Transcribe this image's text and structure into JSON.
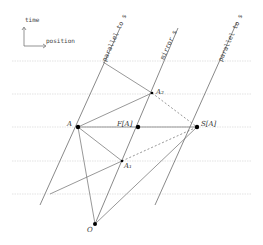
{
  "diagram": {
    "axes": {
      "vertical_label": "time",
      "horizontal_label": "position"
    },
    "world_lines": [
      {
        "id": "left",
        "label": "parallel to s"
      },
      {
        "id": "mirror",
        "label": "mirror s"
      },
      {
        "id": "right",
        "label": "parallel to s"
      }
    ],
    "points": {
      "A": "A",
      "FA": "F[A]",
      "SA": "S[A]",
      "A1": "A₁",
      "A2": "A₂",
      "O": "O"
    },
    "colors": {
      "line": "#6b6b6b",
      "grid": "#e2e2e2",
      "point": "#000000"
    }
  }
}
